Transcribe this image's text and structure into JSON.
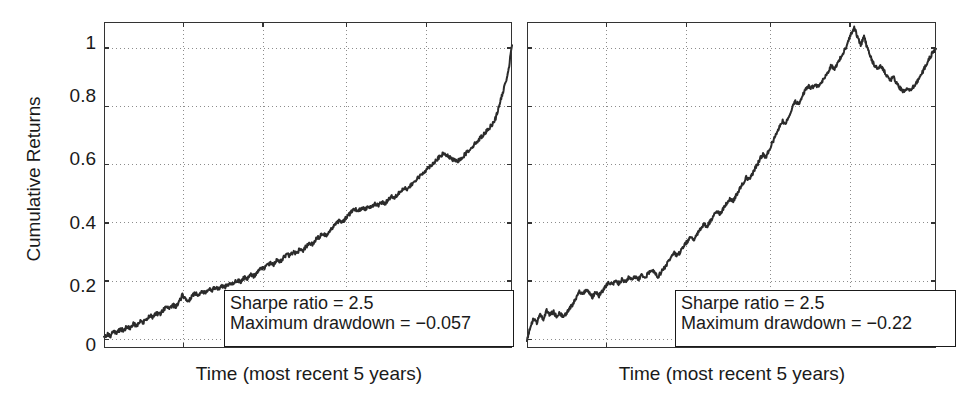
{
  "figure": {
    "background": "#ffffff",
    "line_color": "#2b2b2b",
    "axis_color": "#333333",
    "grid_color": "#8c8c8c"
  },
  "panels": [
    {
      "id": "left",
      "ylabel": "Cumulative Returns",
      "xlabel": "Time (most recent 5 years)",
      "yticks": [
        "0",
        "0.2",
        "0.4",
        "0.6",
        "0.8",
        "1"
      ],
      "annotation": {
        "line1": "Sharpe ratio = 2.5",
        "line2": "Maximum drawdown = −0.057"
      }
    },
    {
      "id": "right",
      "ylabel": "",
      "xlabel": "Time (most recent 5 years)",
      "yticks": [],
      "annotation": {
        "line1": "Sharpe ratio = 2.5",
        "line2": "Maximum drawdown = −0.22"
      }
    }
  ],
  "chart_data": [
    {
      "type": "line",
      "title": "",
      "xlabel": "Time (most recent 5 years)",
      "ylabel": "Cumulative Returns",
      "xlim": [
        0,
        1
      ],
      "ylim": [
        -0.03,
        1.09
      ],
      "yticks": [
        0,
        0.2,
        0.4,
        0.6,
        0.8,
        1
      ],
      "ytick_labels": [
        "0",
        "0.2",
        "0.4",
        "0.6",
        "0.8",
        "1"
      ],
      "xticks": [
        0.195,
        0.39,
        0.595,
        0.79
      ],
      "xtick_labels": [
        "",
        "",
        "",
        ""
      ],
      "grid": true,
      "legend": "none",
      "annotations": [
        "Sharpe ratio = 2.5",
        "Maximum drawdown = −0.057"
      ],
      "sharpe_ratio": 2.5,
      "maximum_drawdown": -0.057,
      "series": [
        {
          "name": "cumulative returns (smooth equity curve)",
          "x": [
            0.0,
            0.008,
            0.016,
            0.024,
            0.032,
            0.04,
            0.048,
            0.056,
            0.064,
            0.072,
            0.08,
            0.088,
            0.096,
            0.104,
            0.112,
            0.12,
            0.128,
            0.136,
            0.144,
            0.152,
            0.16,
            0.168,
            0.176,
            0.184,
            0.192,
            0.2,
            0.208,
            0.216,
            0.224,
            0.232,
            0.24,
            0.248,
            0.256,
            0.264,
            0.272,
            0.28,
            0.288,
            0.296,
            0.304,
            0.312,
            0.32,
            0.328,
            0.336,
            0.344,
            0.352,
            0.36,
            0.368,
            0.376,
            0.384,
            0.392,
            0.4,
            0.408,
            0.416,
            0.424,
            0.432,
            0.44,
            0.448,
            0.456,
            0.464,
            0.472,
            0.48,
            0.488,
            0.496,
            0.504,
            0.512,
            0.52,
            0.528,
            0.536,
            0.544,
            0.552,
            0.56,
            0.568,
            0.576,
            0.584,
            0.592,
            0.6,
            0.608,
            0.616,
            0.624,
            0.632,
            0.64,
            0.648,
            0.656,
            0.664,
            0.672,
            0.68,
            0.688,
            0.696,
            0.704,
            0.712,
            0.72,
            0.728,
            0.736,
            0.744,
            0.752,
            0.76,
            0.768,
            0.776,
            0.784,
            0.792,
            0.8,
            0.808,
            0.816,
            0.824,
            0.832,
            0.84,
            0.848,
            0.856,
            0.864,
            0.872,
            0.88,
            0.888,
            0.896,
            0.904,
            0.912,
            0.92,
            0.928,
            0.936,
            0.944,
            0.952,
            0.96,
            0.968,
            0.976,
            0.984,
            0.992,
            1.0
          ],
          "y": [
            0.005,
            0.018,
            0.012,
            0.027,
            0.022,
            0.035,
            0.03,
            0.044,
            0.038,
            0.052,
            0.047,
            0.062,
            0.057,
            0.07,
            0.082,
            0.076,
            0.09,
            0.085,
            0.098,
            0.11,
            0.104,
            0.118,
            0.112,
            0.126,
            0.152,
            0.14,
            0.133,
            0.148,
            0.158,
            0.152,
            0.166,
            0.161,
            0.172,
            0.168,
            0.178,
            0.174,
            0.184,
            0.179,
            0.19,
            0.186,
            0.196,
            0.204,
            0.198,
            0.212,
            0.208,
            0.222,
            0.216,
            0.232,
            0.248,
            0.242,
            0.256,
            0.262,
            0.256,
            0.272,
            0.266,
            0.282,
            0.292,
            0.286,
            0.3,
            0.296,
            0.31,
            0.306,
            0.32,
            0.332,
            0.326,
            0.344,
            0.352,
            0.362,
            0.356,
            0.372,
            0.384,
            0.396,
            0.406,
            0.4,
            0.416,
            0.428,
            0.44,
            0.446,
            0.44,
            0.452,
            0.448,
            0.458,
            0.454,
            0.464,
            0.46,
            0.47,
            0.466,
            0.478,
            0.492,
            0.486,
            0.5,
            0.512,
            0.52,
            0.514,
            0.528,
            0.54,
            0.552,
            0.562,
            0.574,
            0.586,
            0.596,
            0.606,
            0.618,
            0.628,
            0.638,
            0.632,
            0.624,
            0.616,
            0.61,
            0.618,
            0.628,
            0.64,
            0.652,
            0.664,
            0.676,
            0.688,
            0.7,
            0.712,
            0.726,
            0.74,
            0.76,
            0.8,
            0.84,
            0.88,
            0.93,
            1.01
          ]
        }
      ]
    },
    {
      "type": "line",
      "title": "",
      "xlabel": "Time (most recent 5 years)",
      "ylabel": "",
      "xlim": [
        0,
        1
      ],
      "ylim": [
        -0.03,
        1.09
      ],
      "yticks": [
        0,
        0.2,
        0.4,
        0.6,
        0.8,
        1
      ],
      "ytick_labels": [
        "",
        "",
        "",
        "",
        "",
        ""
      ],
      "xticks": [
        0.195,
        0.39,
        0.595,
        0.79
      ],
      "xtick_labels": [
        "",
        "",
        "",
        ""
      ],
      "grid": true,
      "legend": "none",
      "annotations": [
        "Sharpe ratio = 2.5",
        "Maximum drawdown = −0.22"
      ],
      "sharpe_ratio": 2.5,
      "maximum_drawdown": -0.22,
      "series": [
        {
          "name": "cumulative returns (volatile equity curve)",
          "x": [
            0.0,
            0.008,
            0.016,
            0.024,
            0.032,
            0.04,
            0.048,
            0.056,
            0.064,
            0.072,
            0.08,
            0.088,
            0.096,
            0.104,
            0.112,
            0.12,
            0.128,
            0.136,
            0.144,
            0.152,
            0.16,
            0.168,
            0.176,
            0.184,
            0.192,
            0.2,
            0.208,
            0.216,
            0.224,
            0.232,
            0.24,
            0.248,
            0.256,
            0.264,
            0.272,
            0.28,
            0.288,
            0.296,
            0.304,
            0.312,
            0.32,
            0.328,
            0.336,
            0.344,
            0.352,
            0.36,
            0.368,
            0.376,
            0.384,
            0.392,
            0.4,
            0.408,
            0.416,
            0.424,
            0.432,
            0.44,
            0.448,
            0.456,
            0.464,
            0.472,
            0.48,
            0.488,
            0.496,
            0.504,
            0.512,
            0.52,
            0.528,
            0.536,
            0.544,
            0.552,
            0.56,
            0.568,
            0.576,
            0.584,
            0.592,
            0.6,
            0.608,
            0.616,
            0.624,
            0.632,
            0.64,
            0.648,
            0.656,
            0.664,
            0.672,
            0.68,
            0.688,
            0.696,
            0.704,
            0.712,
            0.72,
            0.728,
            0.736,
            0.744,
            0.752,
            0.76,
            0.768,
            0.776,
            0.784,
            0.792,
            0.8,
            0.808,
            0.816,
            0.824,
            0.832,
            0.84,
            0.848,
            0.856,
            0.864,
            0.872,
            0.88,
            0.888,
            0.896,
            0.904,
            0.912,
            0.92,
            0.928,
            0.936,
            0.944,
            0.952,
            0.96,
            0.968,
            0.976,
            0.984,
            0.992,
            1.0
          ],
          "y": [
            0.0,
            0.04,
            0.07,
            0.055,
            0.085,
            0.07,
            0.1,
            0.082,
            0.096,
            0.078,
            0.092,
            0.076,
            0.09,
            0.106,
            0.12,
            0.14,
            0.166,
            0.15,
            0.172,
            0.158,
            0.146,
            0.162,
            0.15,
            0.165,
            0.18,
            0.195,
            0.188,
            0.2,
            0.192,
            0.205,
            0.198,
            0.21,
            0.204,
            0.215,
            0.206,
            0.218,
            0.21,
            0.225,
            0.24,
            0.228,
            0.215,
            0.23,
            0.246,
            0.262,
            0.28,
            0.296,
            0.286,
            0.304,
            0.32,
            0.336,
            0.352,
            0.344,
            0.362,
            0.38,
            0.396,
            0.386,
            0.404,
            0.422,
            0.44,
            0.43,
            0.448,
            0.466,
            0.484,
            0.476,
            0.496,
            0.516,
            0.536,
            0.556,
            0.548,
            0.57,
            0.592,
            0.614,
            0.636,
            0.626,
            0.65,
            0.676,
            0.7,
            0.726,
            0.75,
            0.74,
            0.766,
            0.792,
            0.818,
            0.806,
            0.832,
            0.856,
            0.87,
            0.862,
            0.876,
            0.868,
            0.882,
            0.9,
            0.92,
            0.94,
            0.93,
            0.95,
            0.97,
            0.99,
            1.02,
            1.05,
            1.07,
            1.04,
            1.01,
            1.04,
            1.0,
            0.97,
            0.945,
            0.93,
            0.94,
            0.925,
            0.905,
            0.89,
            0.9,
            0.88,
            0.862,
            0.85,
            0.86,
            0.852,
            0.866,
            0.88,
            0.9,
            0.92,
            0.945,
            0.965,
            0.985,
            0.998
          ]
        }
      ]
    }
  ]
}
